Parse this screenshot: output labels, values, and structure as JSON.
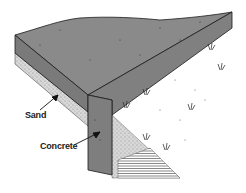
{
  "diagram": {
    "labels": {
      "sand": "Sand",
      "concrete": "Concrete"
    },
    "colors": {
      "concrete": "#8a8a8a",
      "concrete_dark": "#6f6f6f",
      "sand": "#cfcfcf",
      "outline": "#1a1a1a"
    }
  }
}
